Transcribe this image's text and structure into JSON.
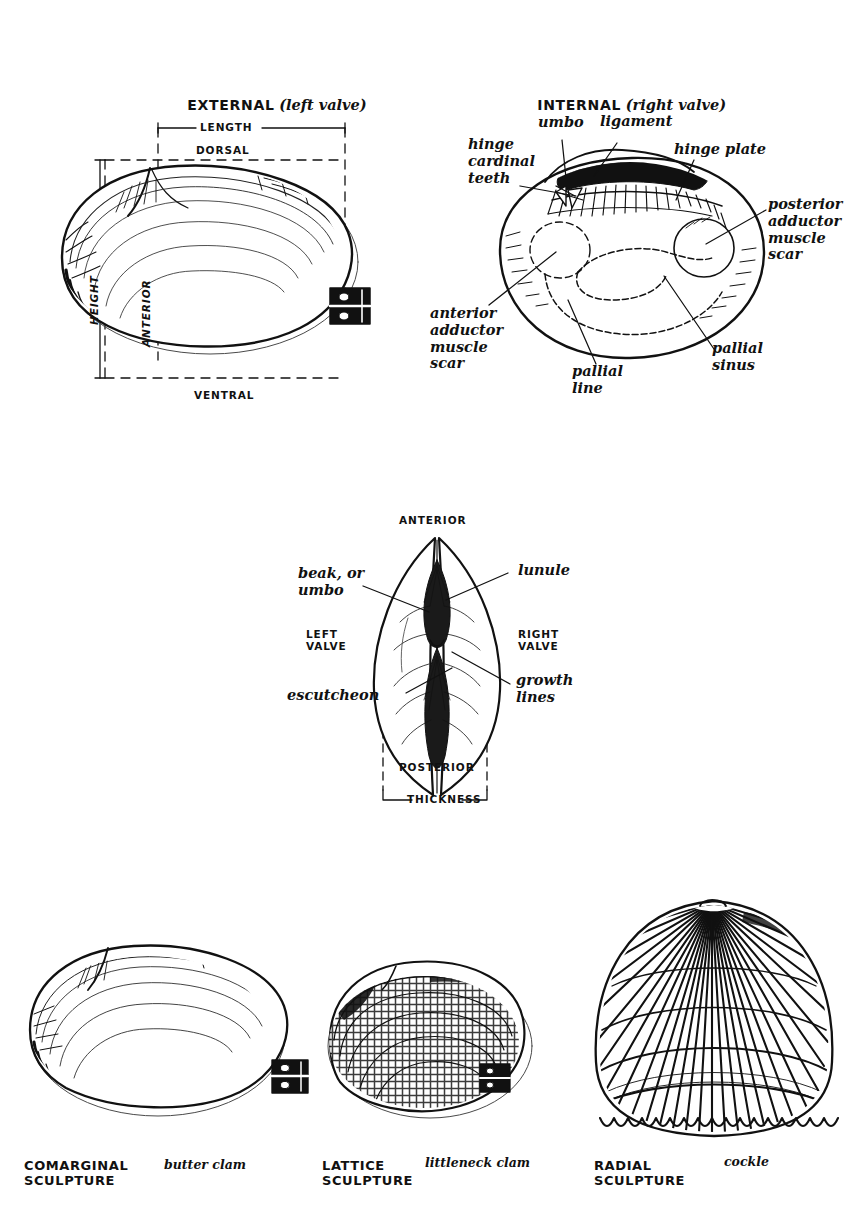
{
  "plate": {
    "background": "#ffffff",
    "ink": "#111111",
    "subject": "bivalve shell anatomy"
  },
  "figures": {
    "external": {
      "title_caps": "EXTERNAL",
      "title_paren": "(left valve)",
      "labels": {
        "length": "LENGTH",
        "dorsal": "DORSAL",
        "height": "HEIGHT",
        "anterior": "ANTERIOR",
        "ventral": "VENTRAL"
      }
    },
    "internal": {
      "title_caps": "INTERNAL",
      "title_paren": "(right valve)",
      "labels": {
        "hinge_cardinal_teeth": "hinge\ncardinal\nteeth",
        "umbo": "umbo",
        "ligament": "ligament",
        "hinge_plate": "hinge plate",
        "posterior_adductor": "posterior\nadductor\nmuscle\nscar",
        "anterior_adductor": "anterior\nadductor\nmuscle\nscar",
        "pallial_line": "pallial\nline",
        "pallial_sinus": "pallial\nsinus"
      }
    },
    "dorsal_view": {
      "labels": {
        "anterior": "ANTERIOR",
        "posterior": "POSTERIOR",
        "thickness": "THICKNESS",
        "left_valve": "LEFT\nVALVE",
        "right_valve": "RIGHT\nVALVE",
        "beak_or_umbo": "beak, or\numbo",
        "lunule": "lunule",
        "escutcheon": "escutcheon",
        "growth_lines": "growth\nlines"
      }
    },
    "sculpture_examples": [
      {
        "type_label": "COMARGINAL\nSCULPTURE",
        "species_label": "butter clam",
        "pattern": "concentric"
      },
      {
        "type_label": "LATTICE\nSCULPTURE",
        "species_label": "littleneck clam",
        "pattern": "lattice"
      },
      {
        "type_label": "RADIAL\nSCULPTURE",
        "species_label": "cockle",
        "pattern": "radial"
      }
    ]
  }
}
